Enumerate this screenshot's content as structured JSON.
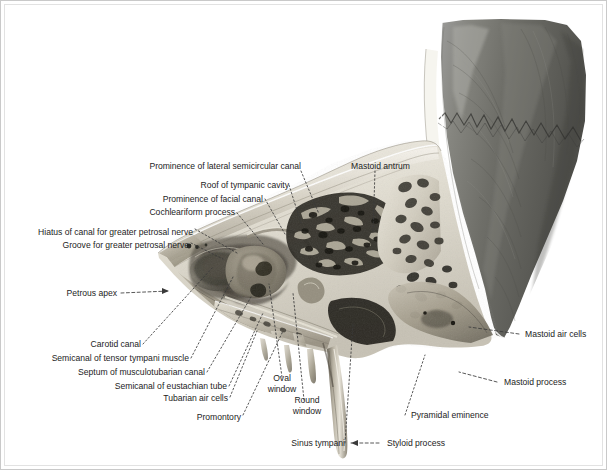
{
  "plate": {
    "title": "Temporal bone — sagittal section of tympanic cavity and mastoid",
    "background_color": "#ffffff",
    "border_color": "#c9c9c9",
    "label_text_color": "#1d1d1d",
    "leader_line_color": "#3a3a3a"
  },
  "labels": {
    "prominence_lateral_semicircular_canal": "Prominence of lateral semicircular canal",
    "roof_of_tympanic_cavity": "Roof of tympanic cavity",
    "prominence_of_facial_canal": "Prominence of facial canal",
    "cochleariform_process": "Cochleariform process",
    "hiatus_of_canal_greater_petrosal_nerve": "Hiatus of canal for greater petrosal nerve",
    "groove_for_greater_petrosal_nerve": "Groove for greater petrosal nerve",
    "petrous_apex": "Petrous apex",
    "carotid_canal": "Carotid canal",
    "semicanal_of_tensor_tympani_muscle": "Semicanal of tensor tympani muscle",
    "septum_of_musculotubarian_canal": "Septum of musculotubarian canal",
    "semicanal_of_eustachian_tube": "Semicanal of eustachian tube",
    "tubarian_air_cells": "Tubarian air cells",
    "promontory": "Promontory",
    "oval_window": "Oval\nwindow",
    "oval_window_line1": "Oval",
    "oval_window_line2": "window",
    "round_window_line1": "Round",
    "round_window_line2": "window",
    "sinus_tympani": "Sinus tympani",
    "mastoid_antrum": "Mastoid antrum",
    "mastoid_air_cells": "Mastoid air cells",
    "mastoid_process": "Mastoid process",
    "pyramidal_eminence": "Pyramidal eminence",
    "styloid_process": "Styloid process"
  }
}
